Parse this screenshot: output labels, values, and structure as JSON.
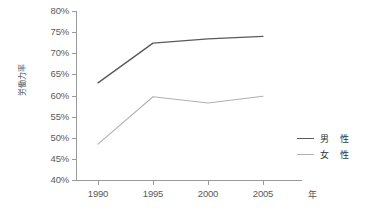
{
  "chart_data": {
    "type": "line",
    "title": "",
    "xlabel": "年",
    "ylabel": "労働力率",
    "categories": [
      "1990",
      "1995",
      "2000",
      "2005"
    ],
    "x": [
      1990,
      1995,
      2000,
      2005
    ],
    "xlim": [
      1988,
      2007
    ],
    "ylim": [
      40,
      80
    ],
    "ytick_labels": [
      "80%",
      "75%",
      "70%",
      "65%",
      "60%",
      "55%",
      "50%",
      "45%",
      "40%"
    ],
    "ytick_values": [
      80,
      75,
      70,
      65,
      60,
      55,
      50,
      45,
      40
    ],
    "grid": false,
    "legend_position": "right",
    "series": [
      {
        "name": "男　性",
        "color": "#5a5a5a",
        "values": [
          63.0,
          72.4,
          73.4,
          74.0
        ]
      },
      {
        "name": "女　性",
        "color": "#b0b0b0",
        "values": [
          48.5,
          59.7,
          58.2,
          59.8
        ]
      }
    ]
  },
  "axes": {
    "y_title": "労働力率",
    "x_title": "年",
    "axis_color": "#9a9a9a",
    "tick_label_color": "#5b5b5b"
  },
  "legend": {
    "items": [
      {
        "label": "男　性",
        "color": "#5a5a5a"
      },
      {
        "label": "女　性",
        "color": "#b0b0b0"
      }
    ]
  }
}
